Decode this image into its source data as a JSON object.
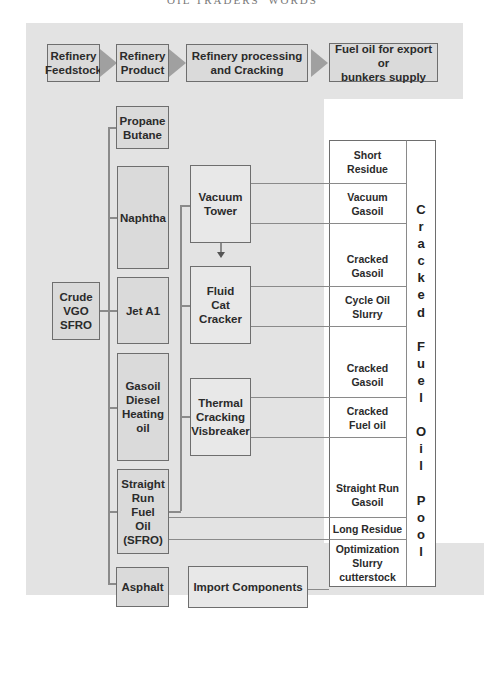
{
  "running_head": "OIL TRADERS' WORDS",
  "top_flow": [
    {
      "label": "Refinery\nFeedstock"
    },
    {
      "label": "Refinery\nProduct"
    },
    {
      "label": "Refinery processing\nand Cracking"
    },
    {
      "label": "Fuel oil for export or\nbunkers  supply"
    }
  ],
  "feedstock": {
    "label": "Crude\nVGO\nSFRO"
  },
  "products": [
    {
      "label": "Propane\nButane"
    },
    {
      "label": "Naphtha"
    },
    {
      "label": "Jet A1"
    },
    {
      "label": "Gasoil\nDiesel\nHeating\noil"
    },
    {
      "label": "Straight\nRun\nFuel\nOil\n(SFRO)"
    },
    {
      "label": "Asphalt"
    }
  ],
  "processing": [
    {
      "label": "Vacuum\nTower"
    },
    {
      "label": "Fluid\nCat\nCracker"
    },
    {
      "label": "Thermal\nCracking\nVisbreaker"
    }
  ],
  "import_components": {
    "label": "Import Components"
  },
  "pool_components": [
    {
      "label": "Short\nResidue"
    },
    {
      "label": "Vacuum\nGasoil"
    },
    {
      "label": "Cracked\nGasoil"
    },
    {
      "label": "Cycle Oil\nSlurry"
    },
    {
      "label": "Cracked\nGasoil"
    },
    {
      "label": "Cracked\nFuel oil"
    },
    {
      "label": "Straight Run\nGasoil"
    },
    {
      "label": "Long Residue"
    },
    {
      "label": "Optimization\nSlurry\ncutterstock"
    }
  ],
  "pool_title": "C\nr\na\nc\nk\ne\nd\n \nF\nu\ne\nl\n \nO\ni\nl\n \nP\no\no\nl"
}
